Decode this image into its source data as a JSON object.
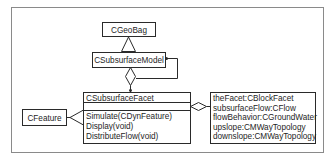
{
  "diagram": {
    "type": "UML class diagram",
    "classes": {
      "geobag": {
        "name": "CGeoBag"
      },
      "model": {
        "name": "CSubsurfaceModel"
      },
      "facet": {
        "name": "CSubsurfaceFacet",
        "attributes": [],
        "methods": [
          "Simulate(CDynFeature)",
          "Display(void)",
          "DistributeFlow(void)"
        ]
      },
      "feature": {
        "name": "CFeature"
      },
      "members": {
        "lines": [
          "theFacet:CBlockFacet",
          "subsurfaceFlow:CFlow",
          "flowBehavior:CGroundWater",
          "upslope:CMWayTopology",
          "downslope:CMWayTopology"
        ]
      }
    },
    "relationships": [
      {
        "kind": "generalization",
        "from": "CSubsurfaceModel",
        "to": "CGeoBag"
      },
      {
        "kind": "aggregation",
        "whole": "CSubsurfaceModel",
        "part": "CSubsurfaceFacet"
      },
      {
        "kind": "self-association",
        "on": "CSubsurfaceModel"
      },
      {
        "kind": "generalization",
        "from": "CSubsurfaceFacet",
        "to": "CFeature"
      },
      {
        "kind": "aggregation",
        "whole": "CSubsurfaceFacet",
        "part": "members"
      }
    ],
    "colors": {
      "line": "#2a2a2a",
      "frame": "#8a8a8a",
      "background": "#ffffff"
    }
  }
}
